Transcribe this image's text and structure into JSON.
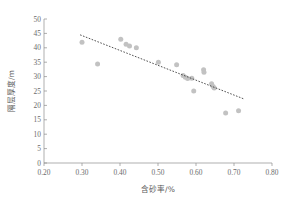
{
  "chart_data": {
    "type": "scatter",
    "title": "",
    "xlabel": "含砂率/%",
    "ylabel": "隔层厚度/m",
    "xlim": [
      0.2,
      0.8
    ],
    "ylim": [
      0,
      50
    ],
    "xticks": [
      "0.20",
      "0.30",
      "0.40",
      "0.50",
      "0.60",
      "0.70",
      "0.80"
    ],
    "xtick_values": [
      0.2,
      0.3,
      0.4,
      0.5,
      0.6,
      0.7,
      0.8
    ],
    "yticks": [
      "0",
      "5",
      "10",
      "15",
      "20",
      "25",
      "30",
      "35",
      "40",
      "45",
      "50"
    ],
    "ytick_values": [
      0,
      5,
      10,
      15,
      20,
      25,
      30,
      35,
      40,
      45,
      50
    ],
    "grid": false,
    "legend": false,
    "point_color": "#c2c2c2",
    "trend_color": "#3d3d3d",
    "series": [
      {
        "name": "samples",
        "marker": "circle",
        "points": [
          {
            "x": 0.3,
            "y": 41.9
          },
          {
            "x": 0.341,
            "y": 34.4
          },
          {
            "x": 0.402,
            "y": 43.0
          },
          {
            "x": 0.416,
            "y": 41.2
          },
          {
            "x": 0.425,
            "y": 40.6
          },
          {
            "x": 0.443,
            "y": 40.0
          },
          {
            "x": 0.501,
            "y": 35.0
          },
          {
            "x": 0.549,
            "y": 34.1
          },
          {
            "x": 0.566,
            "y": 30.4
          },
          {
            "x": 0.572,
            "y": 29.8
          },
          {
            "x": 0.578,
            "y": 29.3
          },
          {
            "x": 0.589,
            "y": 29.4
          },
          {
            "x": 0.594,
            "y": 25.0
          },
          {
            "x": 0.62,
            "y": 32.4
          },
          {
            "x": 0.621,
            "y": 31.5
          },
          {
            "x": 0.641,
            "y": 27.5
          },
          {
            "x": 0.645,
            "y": 26.6
          },
          {
            "x": 0.648,
            "y": 26.0
          },
          {
            "x": 0.678,
            "y": 17.4
          },
          {
            "x": 0.712,
            "y": 18.1
          }
        ]
      }
    ],
    "trendline": {
      "name": "linear-fit",
      "style": "dotted",
      "x_start": 0.295,
      "y_start": 44.5,
      "x_end": 0.725,
      "y_end": 22.3
    }
  }
}
